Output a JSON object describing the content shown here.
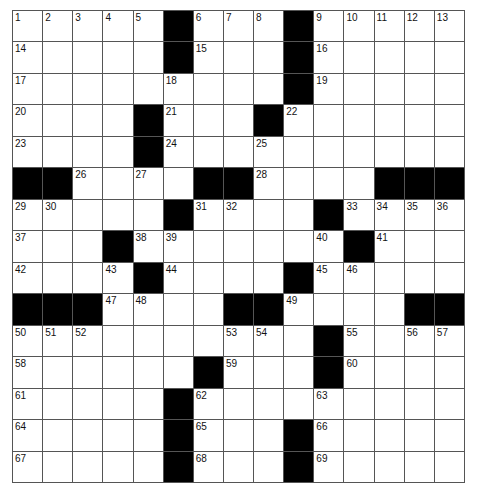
{
  "puzzle": {
    "rows": 15,
    "cols": 15,
    "pattern": [
      ".....#...#.....",
      ".....#...#.....",
      ".........#.....",
      "....#...#......",
      "....#..........",
      "##....##....###",
      ".....#....#....",
      "...#.......#...",
      "....#....#.....",
      "###....##....##",
      "..........#....",
      "......#...#....",
      ".....#.........",
      ".....#...#.....",
      ".....#...#....."
    ],
    "numbers": [
      [
        1,
        2,
        3,
        4,
        5,
        0,
        6,
        7,
        8,
        0,
        9,
        10,
        11,
        12,
        13
      ],
      [
        14,
        0,
        0,
        0,
        0,
        0,
        15,
        0,
        0,
        0,
        16,
        0,
        0,
        0,
        0
      ],
      [
        17,
        0,
        0,
        0,
        0,
        18,
        0,
        0,
        0,
        0,
        19,
        0,
        0,
        0,
        0
      ],
      [
        20,
        0,
        0,
        0,
        0,
        21,
        0,
        0,
        0,
        22,
        0,
        0,
        0,
        0,
        0
      ],
      [
        23,
        0,
        0,
        0,
        0,
        24,
        0,
        0,
        25,
        0,
        0,
        0,
        0,
        0,
        0
      ],
      [
        0,
        0,
        26,
        0,
        27,
        0,
        0,
        0,
        28,
        0,
        0,
        0,
        0,
        0,
        0
      ],
      [
        29,
        30,
        0,
        0,
        0,
        0,
        31,
        32,
        0,
        0,
        0,
        33,
        34,
        35,
        36
      ],
      [
        37,
        0,
        0,
        0,
        38,
        39,
        0,
        0,
        0,
        0,
        40,
        0,
        41,
        0,
        0
      ],
      [
        42,
        0,
        0,
        43,
        0,
        44,
        0,
        0,
        0,
        0,
        45,
        46,
        0,
        0,
        0
      ],
      [
        0,
        0,
        0,
        47,
        48,
        0,
        0,
        0,
        0,
        49,
        0,
        0,
        0,
        0,
        0
      ],
      [
        50,
        51,
        52,
        0,
        0,
        0,
        0,
        53,
        54,
        0,
        0,
        55,
        0,
        56,
        57
      ],
      [
        58,
        0,
        0,
        0,
        0,
        0,
        0,
        59,
        0,
        0,
        0,
        60,
        0,
        0,
        0
      ],
      [
        61,
        0,
        0,
        0,
        0,
        0,
        62,
        0,
        0,
        0,
        63,
        0,
        0,
        0,
        0
      ],
      [
        64,
        0,
        0,
        0,
        0,
        0,
        65,
        0,
        0,
        0,
        66,
        0,
        0,
        0,
        0
      ],
      [
        67,
        0,
        0,
        0,
        0,
        0,
        68,
        0,
        0,
        0,
        69,
        0,
        0,
        0,
        0
      ]
    ],
    "colors": {
      "block": "#000000",
      "cell": "#ffffff",
      "line": "#555555"
    }
  }
}
